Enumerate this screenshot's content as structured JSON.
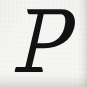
{
  "image": {
    "width": 87,
    "height": 87,
    "kind": "scanned-glyph",
    "background_color": "#f5f5f3",
    "ink_color": "#121212",
    "edge_shadow_color": "#6a6863"
  },
  "glyph": {
    "character": "P",
    "name": "latin-capital-letter-p",
    "style": "italic",
    "serif": true,
    "weight": "regular",
    "color": "#121212",
    "bounds": {
      "left": 16,
      "top": 8,
      "right": 69,
      "bottom": 73
    },
    "features": {
      "top_serif": "flat",
      "foot_serif": "flat-wide",
      "bowl_closes_x": 68,
      "bowl_rejoins_stem_y": 45,
      "baseline_y": 72
    }
  }
}
